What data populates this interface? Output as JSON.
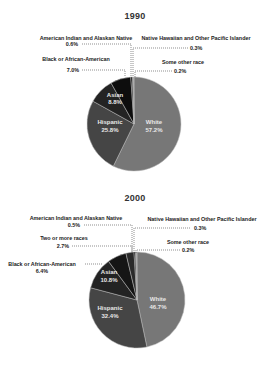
{
  "chart_data": [
    {
      "type": "pie",
      "title": "1990",
      "center": [
        134,
        124
      ],
      "radius": 47,
      "slices": [
        {
          "label": "White",
          "value": 57.2,
          "display": "57.2%",
          "color": "#777777",
          "label_pos": "inside",
          "lx": 152,
          "ly": 123
        },
        {
          "label": "Hispanic",
          "value": 25.8,
          "display": "25.8%",
          "color": "#454545",
          "label_pos": "inside",
          "lx": 110,
          "ly": 123
        },
        {
          "label": "Asian",
          "value": 8.8,
          "display": "8.8%",
          "color": "#232323",
          "label_pos": "inside",
          "lx": 115,
          "ly": 98
        },
        {
          "label": "Black or African-American",
          "value": 7.0,
          "display": "7.0%",
          "color": "#0d0d0d",
          "label_pos": "outside",
          "lx": 74,
          "ly": 60,
          "leader": [
            [
              82,
              70
            ],
            [
              125,
              70
            ],
            [
              125,
              77
            ]
          ]
        },
        {
          "label": "American Indian and Alaskan Native",
          "value": 0.6,
          "display": "0.6%",
          "color": "#111111",
          "label_pos": "outside",
          "lx": 74,
          "ly": 36,
          "leader": [
            [
              82,
              44
            ],
            [
              131,
              44
            ],
            [
              131,
              77
            ]
          ]
        },
        {
          "label": "Native Hawaiian and Other Pacific Islander",
          "value": 0.3,
          "display": "0.3%",
          "color": "#444444",
          "label_pos": "outside",
          "lx": 188,
          "ly": 38,
          "leader": [
            [
              188,
              48
            ],
            [
              133,
              48
            ],
            [
              133,
              77
            ]
          ]
        },
        {
          "label": "Some other race",
          "value": 0.2,
          "display": "0.2%",
          "color": "#888888",
          "label_pos": "outside",
          "lx": 180,
          "ly": 62,
          "leader": [
            [
              172,
              71
            ],
            [
              135,
              71
            ],
            [
              135,
              77
            ]
          ]
        }
      ]
    },
    {
      "type": "pie",
      "title": "2000",
      "center": [
        137,
        300
      ],
      "radius": 48,
      "slices": [
        {
          "label": "White",
          "value": 46.7,
          "display": "46.7%",
          "color": "#777777",
          "label_pos": "inside",
          "lx": 157,
          "ly": 305
        },
        {
          "label": "Hispanic",
          "value": 32.4,
          "display": "32.4%",
          "color": "#454545",
          "label_pos": "inside",
          "lx": 111,
          "ly": 316
        },
        {
          "label": "Asian",
          "value": 10.8,
          "display": "10.8%",
          "color": "#232323",
          "label_pos": "inside",
          "lx": 111,
          "ly": 276
        },
        {
          "label": "Black or African-American",
          "value": 6.4,
          "display": "6.4%",
          "color": "#151515",
          "label_pos": "outside",
          "lx": 42,
          "ly": 264,
          "leader": [
            [
              85,
              264
            ],
            [
              103,
              264
            ]
          ]
        },
        {
          "label": "Two or more races",
          "value": 2.7,
          "display": "2.7%",
          "color": "#2a2a2a",
          "label_pos": "outside",
          "lx": 64,
          "ly": 240,
          "leader": [
            [
              72,
              246
            ],
            [
              132,
              246
            ],
            [
              132,
              253
            ]
          ]
        },
        {
          "label": "American Indian and Alaskan Native",
          "value": 0.5,
          "display": "0.5%",
          "color": "#0a0a0a",
          "label_pos": "outside",
          "lx": 74,
          "ly": 217,
          "leader": [
            [
              84,
              225
            ],
            [
              132,
              225
            ],
            [
              132,
              253
            ]
          ]
        },
        {
          "label": "Native Hawaiian and Other Pacific Islander",
          "value": 0.3,
          "display": "0.3%",
          "color": "#444444",
          "label_pos": "outside",
          "lx": 196,
          "ly": 218,
          "leader": [
            [
              190,
              228
            ],
            [
              134,
              228
            ],
            [
              134,
              253
            ]
          ]
        },
        {
          "label": "Some other race",
          "value": 0.2,
          "display": "0.2%",
          "color": "#888888",
          "label_pos": "outside",
          "lx": 186,
          "ly": 241,
          "leader": [
            [
              180,
              250
            ],
            [
              136,
              250
            ],
            [
              136,
              253
            ]
          ]
        }
      ]
    }
  ],
  "charts": {
    "c1990": {
      "title": "1990",
      "white": {
        "name": "White",
        "pct": "57.2%"
      },
      "hispanic": {
        "name": "Hispanic",
        "pct": "25.8%"
      },
      "asian": {
        "name": "Asian",
        "pct": "8.8%"
      },
      "black": {
        "name": "Black or African-American",
        "pct": "7.0%"
      },
      "amind": {
        "name": "American Indian and Alaskan Native",
        "pct": "0.6%"
      },
      "nhpi": {
        "name": "Native Hawaiian and Other Pacific Islander",
        "pct": "0.3%"
      },
      "other": {
        "name": "Some other race",
        "pct": "0.2%"
      }
    },
    "c2000": {
      "title": "2000",
      "white": {
        "name": "White",
        "pct": "46.7%"
      },
      "hispanic": {
        "name": "Hispanic",
        "pct": "32.4%"
      },
      "asian": {
        "name": "Asian",
        "pct": "10.8%"
      },
      "black": {
        "name": "Black or African-American",
        "pct": "6.4%"
      },
      "two": {
        "name": "Two or more races",
        "pct": "2.7%"
      },
      "amind": {
        "name": "American Indian and Alaskan Native",
        "pct": "0.5%"
      },
      "nhpi": {
        "name": "Native Hawaiian and Other Pacific Islander",
        "pct": "0.3%"
      },
      "other": {
        "name": "Some other race",
        "pct": "0.2%"
      }
    }
  }
}
